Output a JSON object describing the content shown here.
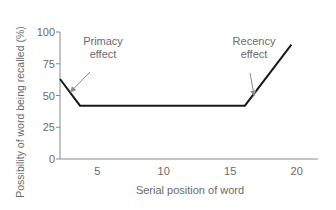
{
  "chart_data": {
    "type": "line",
    "title": "",
    "xlabel": "Serial position of word",
    "ylabel": "Possibility of word being recalled (%)",
    "x_ticks": [
      5,
      10,
      15,
      20
    ],
    "y_ticks": [
      0,
      25,
      50,
      75,
      100
    ],
    "xlim": [
      2.2,
      21.5
    ],
    "ylim": [
      0,
      100
    ],
    "grid": false,
    "legend": null,
    "series": [
      {
        "name": "Recall probability",
        "x": [
          2.2,
          3.7,
          16.1,
          19.6
        ],
        "y": [
          63,
          42,
          42,
          90
        ]
      }
    ],
    "annotations": [
      {
        "text_lines": [
          "Primacy",
          "effect"
        ],
        "label": "Primacy effect",
        "points_to": [
          3.0,
          53
        ]
      },
      {
        "text_lines": [
          "Recency",
          "effect"
        ],
        "label": "Recency effect",
        "points_to": [
          16.8,
          50
        ]
      }
    ]
  },
  "colors": {
    "line": "#1a1a1a",
    "axis": "#8a8a8a",
    "text": "#6a6a6a",
    "arrow": "#8a8a8a"
  }
}
